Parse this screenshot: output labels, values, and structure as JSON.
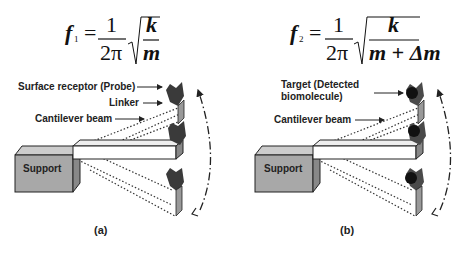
{
  "panel_a": {
    "equation": {
      "lhs": "f",
      "subscript": "1",
      "numerator": "1",
      "denominator": "2π",
      "root_numerator": "k",
      "root_denominator": "m"
    },
    "labels": {
      "probe": "Surface receptor (Probe)",
      "linker": "Linker",
      "beam": "Cantilever beam",
      "support": "Support"
    },
    "caption": "(a)"
  },
  "panel_b": {
    "equation": {
      "lhs": "f",
      "subscript": "2",
      "numerator": "1",
      "denominator": "2π",
      "root_numerator": "k",
      "root_denominator": "m + Δm"
    },
    "labels": {
      "target_line1": "Target (Detected",
      "target_line2": "biomolecule)",
      "beam": "Cantilever beam",
      "support": "Support"
    },
    "caption": "(b)"
  },
  "colors": {
    "support_fill": "#a8a8a8",
    "probe_fill": "#3a3a3a",
    "target_fill": "#111111",
    "line": "#222222"
  }
}
